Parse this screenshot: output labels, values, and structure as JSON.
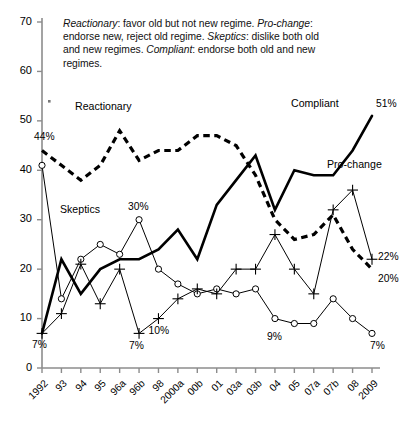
{
  "caption": {
    "segments": [
      {
        "text": "Reactionary",
        "italic": true
      },
      {
        "text": ": favor old but not new regime. ",
        "italic": false
      },
      {
        "text": "Pro-change",
        "italic": true
      },
      {
        "text": ": endorse new, reject old regime. ",
        "italic": false
      },
      {
        "text": "Skeptics",
        "italic": true
      },
      {
        "text": ": dislike both old and new regimes. ",
        "italic": false
      },
      {
        "text": "Compliant",
        "italic": true
      },
      {
        "text": ": endorse both old and new regimes.",
        "italic": false
      }
    ],
    "plain": "Reactionary: favor old but not new regime. Pro-change: endorse new, reject old regime. Skeptics: dislike both old and new regimes. Compliant: endorse both old and new regimes."
  },
  "series_labels": {
    "reactionary": "Reactionary",
    "skeptics": "Skeptics",
    "compliant": "Compliant",
    "prochange": "Pro-change"
  },
  "chart_data": {
    "type": "line",
    "title": "",
    "xlabel": "",
    "ylabel": "",
    "ylim": [
      0,
      70
    ],
    "yticks": [
      0,
      10,
      20,
      30,
      40,
      50,
      60,
      70
    ],
    "grid": false,
    "legend": "inline-annotations",
    "categories": [
      "1992",
      "93",
      "94",
      "95",
      "96a",
      "96b",
      "98",
      "2000a",
      "00b",
      "01",
      "03a",
      "03b",
      "04",
      "05",
      "07a",
      "07b",
      "08",
      "2009"
    ],
    "series": [
      {
        "name": "Reactionary",
        "style": "thick-dashed",
        "marker": "none",
        "values": [
          44,
          41,
          38,
          41,
          48,
          42,
          44,
          44,
          47,
          47,
          45,
          39,
          30,
          26,
          27,
          31,
          24,
          20
        ]
      },
      {
        "name": "Compliant",
        "style": "thick-solid",
        "marker": "none",
        "values": [
          7,
          22,
          15,
          20,
          22,
          22,
          24,
          28,
          22,
          33,
          38,
          43,
          32,
          40,
          39,
          39,
          44,
          51
        ]
      },
      {
        "name": "Skeptics",
        "style": "thin-solid",
        "marker": "open-circle",
        "values": [
          41,
          14,
          22,
          25,
          23,
          30,
          20,
          17,
          15,
          16,
          15,
          16,
          10,
          9,
          9,
          14,
          10,
          7
        ]
      },
      {
        "name": "Pro-change",
        "style": "thin-solid",
        "marker": "plus",
        "values": [
          7,
          11,
          21,
          13,
          20,
          7,
          10,
          14,
          16,
          15,
          20,
          20,
          27,
          20,
          15,
          32,
          36,
          22
        ]
      }
    ],
    "data_labels": [
      {
        "text": "44%",
        "series": "Reactionary",
        "category": "1992",
        "value": 44
      },
      {
        "text": "7%",
        "series": "Compliant",
        "category": "1992",
        "value": 7
      },
      {
        "text": "30%",
        "series": "Skeptics",
        "category": "96b",
        "value": 30
      },
      {
        "text": "7%",
        "series": "Pro-change",
        "category": "96b",
        "value": 7
      },
      {
        "text": "10%",
        "series": "Pro-change",
        "category": "98",
        "value": 10
      },
      {
        "text": "9%",
        "series": "Skeptics",
        "category": "04",
        "value": 9
      },
      {
        "text": "51%",
        "series": "Compliant",
        "category": "2009",
        "value": 51
      },
      {
        "text": "22%",
        "series": "Pro-change",
        "category": "2009",
        "value": 22
      },
      {
        "text": "20%",
        "series": "Reactionary",
        "category": "2009",
        "value": 20
      },
      {
        "text": "7%",
        "series": "Skeptics",
        "category": "2009",
        "value": 7
      }
    ],
    "annotations": [
      {
        "text": "Reactionary",
        "x": 75,
        "y": 100
      },
      {
        "text": "Skeptics",
        "x": 60,
        "y": 203
      },
      {
        "text": "Compliant",
        "x": 291,
        "y": 97
      },
      {
        "text": "Pro-change",
        "x": 327,
        "y": 158
      }
    ]
  },
  "colors": {
    "axis": "#8c8c8c",
    "line": "#000000",
    "text": "#000000",
    "background": "#ffffff"
  }
}
